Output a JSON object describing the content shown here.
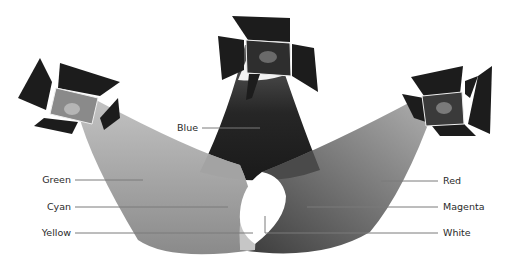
{
  "diagram": {
    "type": "additive-color-mixing",
    "lights": [
      {
        "id": "left",
        "beam_color_name": "Green"
      },
      {
        "id": "top",
        "beam_color_name": "Blue"
      },
      {
        "id": "right",
        "beam_color_name": "Red"
      }
    ],
    "labels": {
      "blue": "Blue",
      "green": "Green",
      "cyan": "Cyan",
      "yellow": "Yellow",
      "red": "Red",
      "magenta": "Magenta",
      "white": "White"
    },
    "tones": {
      "barn_door": "#1c1c1c",
      "lamp_face_left": "#8a8a8a",
      "lamp_face_top": "#2e2e2e",
      "lamp_face_right": "#3a3a3a",
      "bulb_left": "#b5b5b5",
      "bulb_top": "#6a6a6a",
      "bulb_right": "#7a7a7a",
      "green_beam": "#8c8c8c",
      "blue_beam": "#2a2a2a",
      "red_beam": "#5a5a5a",
      "cyan_overlap": "#9a9a9a",
      "yellow_overlap": "#c8c8c8",
      "magenta_overlap": "#3e3e3e",
      "white_overlap": "#ffffff",
      "leader_line": "#7a7a7a"
    }
  }
}
